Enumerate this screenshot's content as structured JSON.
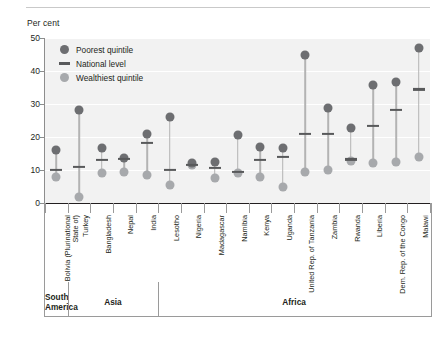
{
  "axis_title": "Per cent",
  "legend": {
    "items": [
      {
        "key": "poorest",
        "label": "Poorest quintile",
        "marker": "circle-dark",
        "color": "#6d6e71"
      },
      {
        "key": "national",
        "label": "National level",
        "marker": "dash",
        "color": "#58595b"
      },
      {
        "key": "wealthiest",
        "label": "Wealthiest quintile",
        "marker": "circle-light",
        "color": "#a7a9ac"
      }
    ]
  },
  "regions": [
    {
      "label": "South America",
      "lines": [
        "South",
        "America"
      ],
      "start": 0,
      "end": 1
    },
    {
      "label": "Asia",
      "lines": [
        "Asia"
      ],
      "start": 1,
      "end": 5
    },
    {
      "label": "Africa",
      "lines": [
        "Africa"
      ],
      "start": 5,
      "end": 17
    }
  ],
  "chart_data": {
    "type": "scatter",
    "title": "",
    "subtitle": "",
    "xlabel": "",
    "ylabel": "Per cent",
    "ylim": [
      0,
      50
    ],
    "yticks": [
      0,
      10,
      20,
      30,
      40,
      50
    ],
    "grid": true,
    "legend_position": "top-left",
    "categories": [
      "Bolivia (Plurinational State of)",
      "Turkey",
      "Bangladesh",
      "Nepal",
      "India",
      "Lesotho",
      "Nigeria",
      "Madagascar",
      "Namibia",
      "Kenya",
      "Uganda",
      "United Rep. of Tanzania",
      "Zambia",
      "Rwanda",
      "Liberia",
      "Dem. Rep. of the Congo",
      "Malawi"
    ],
    "series": [
      {
        "name": "Poorest quintile",
        "values": [
          16.2,
          28.3,
          16.8,
          13.6,
          21.0,
          26.0,
          12.0,
          12.5,
          20.6,
          17.0,
          16.6,
          45.0,
          28.8,
          22.8,
          35.8,
          36.8,
          47.0
        ]
      },
      {
        "name": "National level",
        "values": [
          10.0,
          11.0,
          13.0,
          13.4,
          18.2,
          10.0,
          11.6,
          10.6,
          9.4,
          13.0,
          14.0,
          21.0,
          21.0,
          13.2,
          23.4,
          28.2,
          34.4
        ]
      },
      {
        "name": "Wealthiest quintile",
        "values": [
          8.0,
          1.8,
          9.0,
          9.5,
          8.4,
          5.4,
          11.6,
          7.6,
          9.0,
          7.8,
          5.0,
          9.4,
          10.0,
          12.6,
          12.0,
          12.4,
          14.0
        ]
      }
    ]
  }
}
